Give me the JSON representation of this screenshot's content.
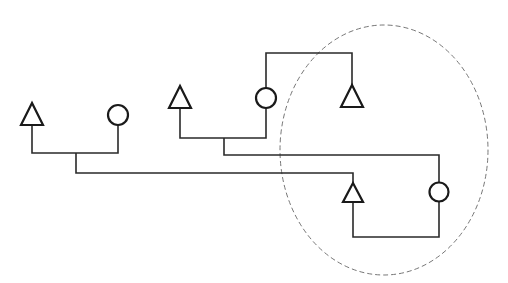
{
  "diagram": {
    "type": "pedigree-like tree",
    "colors": {
      "line": "#2a2a2a",
      "shape": "#1a1a1a",
      "group_outline": "#777777",
      "background": "#ffffff"
    },
    "nodes": [
      {
        "id": "n1",
        "shape": "triangle",
        "x": 31,
        "y": 114
      },
      {
        "id": "n2",
        "shape": "circle",
        "x": 118,
        "y": 115
      },
      {
        "id": "n3",
        "shape": "triangle",
        "x": 180,
        "y": 97
      },
      {
        "id": "n4",
        "shape": "circle",
        "x": 266,
        "y": 98
      },
      {
        "id": "n5",
        "shape": "triangle",
        "x": 352,
        "y": 96
      },
      {
        "id": "n6",
        "shape": "triangle",
        "x": 353,
        "y": 192
      },
      {
        "id": "n7",
        "shape": "circle",
        "x": 439,
        "y": 192
      }
    ],
    "group": {
      "shape": "dashed-ellipse",
      "cx": 384,
      "cy": 150,
      "rx": 104,
      "ry": 125,
      "contains": [
        "n5",
        "n6",
        "n7"
      ]
    }
  }
}
